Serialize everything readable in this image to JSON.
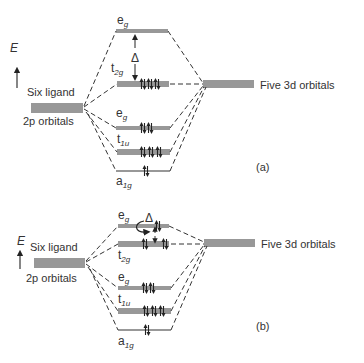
{
  "axis": {
    "label": "E"
  },
  "ligand": {
    "line1": "Six ligand",
    "line2": "2p orbitals"
  },
  "metal": {
    "label": "Five 3d orbitals"
  },
  "delta": "Δ",
  "panels": [
    {
      "tag": "(a)",
      "levels": {
        "eg_upper": {
          "main": "e",
          "sub": "g",
          "electrons": 0
        },
        "t2g": {
          "main": "t",
          "sub": "2g",
          "electrons": 6
        },
        "eg_lower": {
          "main": "e",
          "sub": "g",
          "electrons": 4
        },
        "t1u": {
          "main": "t",
          "sub": "1u",
          "electrons": 6
        },
        "a1g": {
          "main": "a",
          "sub": "1g",
          "electrons": 2
        }
      },
      "description": "Strong field: large Δ, low spin"
    },
    {
      "tag": "(b)",
      "levels": {
        "eg_upper": {
          "main": "e",
          "sub": "g",
          "electrons": 2
        },
        "t2g": {
          "main": "t",
          "sub": "2g",
          "electrons": 4
        },
        "eg_lower": {
          "main": "e",
          "sub": "g",
          "electrons": 4
        },
        "t1u": {
          "main": "t",
          "sub": "1u",
          "electrons": 6
        },
        "a1g": {
          "main": "a",
          "sub": "1g",
          "electrons": 2
        }
      },
      "description": "Weak field: small Δ, high spin"
    }
  ]
}
